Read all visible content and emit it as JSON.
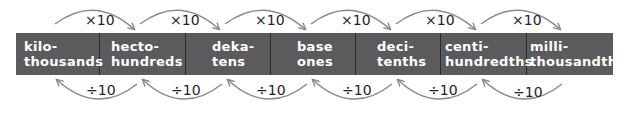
{
  "diagram": {
    "bar_color": "#5b5b5d",
    "text_color": "#ffffff",
    "arrow_color": "#8a8a8a",
    "cells": [
      {
        "prefix": "kilo-",
        "place": "thousands"
      },
      {
        "prefix": "hecto-",
        "place": "hundreds"
      },
      {
        "prefix": "deka-",
        "place": "tens"
      },
      {
        "prefix": "base",
        "place": "ones"
      },
      {
        "prefix": "deci-",
        "place": "tenths"
      },
      {
        "prefix": "centi-",
        "place": "hundredths"
      },
      {
        "prefix": "milli-",
        "place": "thousandths"
      }
    ],
    "top_arrows": [
      {
        "label": "×10"
      },
      {
        "label": "×10"
      },
      {
        "label": "×10"
      },
      {
        "label": "×10"
      },
      {
        "label": "×10"
      },
      {
        "label": "×10"
      }
    ],
    "bottom_arrows": [
      {
        "label": "÷10"
      },
      {
        "label": "÷10"
      },
      {
        "label": "÷10"
      },
      {
        "label": "÷10"
      },
      {
        "label": "÷10"
      },
      {
        "label": "÷10"
      }
    ]
  }
}
